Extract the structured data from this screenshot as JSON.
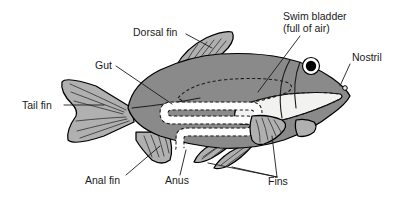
{
  "figure": {
    "orientation": "facing right",
    "background_color": "#ffffff"
  },
  "colors": {
    "body_fill": "#8a8a8a",
    "fin_fill": "#b0b0b0",
    "cavity_fill": "#f2f2f0",
    "gut_fill": "#ffffff",
    "outline": "#000000",
    "label_text": "#1a1a1a",
    "eye_pupil": "#000000",
    "eye_ring": "#ffffff"
  },
  "labels": [
    {
      "id": "dorsal-fin",
      "text": "Dorsal fin",
      "x": 133,
      "y": 36,
      "anchor": "start"
    },
    {
      "id": "gut",
      "text": "Gut",
      "x": 95,
      "y": 69,
      "anchor": "start"
    },
    {
      "id": "tail-fin",
      "text": "Tail fin",
      "x": 22,
      "y": 109,
      "anchor": "start"
    },
    {
      "id": "swim-bladder-line1",
      "text": "Swim bladder",
      "x": 283,
      "y": 20,
      "anchor": "start"
    },
    {
      "id": "swim-bladder-line2",
      "text": "(full of air)",
      "x": 283,
      "y": 32,
      "anchor": "start"
    },
    {
      "id": "nostril",
      "text": "Nostril",
      "x": 352,
      "y": 61,
      "anchor": "start"
    },
    {
      "id": "anal-fin",
      "text": "Anal fin",
      "x": 85,
      "y": 184,
      "anchor": "start"
    },
    {
      "id": "anus",
      "text": "Anus",
      "x": 165,
      "y": 184,
      "anchor": "start"
    },
    {
      "id": "fins",
      "text": "Fins",
      "x": 268,
      "y": 185,
      "anchor": "start"
    }
  ],
  "parts": [
    {
      "id": "body",
      "name": "fish body"
    },
    {
      "id": "tail-fin",
      "name": "tail fin"
    },
    {
      "id": "dorsal-fin",
      "name": "dorsal fin"
    },
    {
      "id": "anal-fin",
      "name": "anal fin"
    },
    {
      "id": "pelvic-fin",
      "name": "pelvic fin"
    },
    {
      "id": "pectoral-fin",
      "name": "pectoral fin"
    },
    {
      "id": "gill-fin",
      "name": "gill cover fin"
    },
    {
      "id": "eye",
      "name": "eye"
    },
    {
      "id": "nostril",
      "name": "nostril"
    },
    {
      "id": "swim-bladder",
      "name": "swim bladder"
    },
    {
      "id": "gut",
      "name": "gut"
    },
    {
      "id": "mouth-cavity",
      "name": "mouth and gill cavity"
    },
    {
      "id": "anus",
      "name": "anus"
    }
  ]
}
